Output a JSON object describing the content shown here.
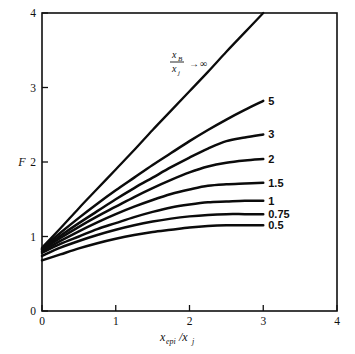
{
  "figure": {
    "background_color": "#ffffff",
    "line_color": "#0b0b0b",
    "axis_color": "#101010"
  },
  "axes": {
    "x_label_base": "x",
    "x_label_sub1": "epi",
    "x_label_slash": "/x",
    "x_label_sub2": "j",
    "y_label": "F",
    "x_ticks": [
      "0",
      "1",
      "2",
      "3",
      "4"
    ],
    "y_ticks": [
      "0",
      "1",
      "2",
      "3",
      "4"
    ]
  },
  "annotation": {
    "numerator_base": "x",
    "numerator_sub": "B",
    "denominator_base": "x",
    "denominator_sub": "j",
    "arrow": "→",
    "infinity": "∞"
  },
  "chart_data": {
    "type": "line",
    "title": "",
    "subtitle": "",
    "xlabel": "x_epi/x_j",
    "ylabel": "F",
    "xlim": [
      0,
      4
    ],
    "ylim": [
      0,
      4
    ],
    "grid": false,
    "legend_position": "inline-right-of-curve-ends",
    "x_tick_values": [
      0,
      1,
      2,
      3,
      4
    ],
    "y_tick_values": [
      0,
      1,
      2,
      3,
      4
    ],
    "annotations": [
      {
        "text": "x_B/x_j → ∞",
        "x": 1.15,
        "y": 3.25,
        "refers_to_series": "infinity"
      }
    ],
    "series": [
      {
        "name": "infinity",
        "label": "x_B/x_j → ∞",
        "x": [
          0,
          0.25,
          0.5,
          0.75,
          1,
          1.25,
          1.5,
          1.75,
          2,
          2.25,
          2.5,
          2.75,
          3
        ],
        "values": [
          0.85,
          1.11,
          1.38,
          1.64,
          1.9,
          2.16,
          2.43,
          2.69,
          2.95,
          3.21,
          3.48,
          3.74,
          4.0
        ]
      },
      {
        "name": "5",
        "label": "5",
        "x": [
          0,
          0.25,
          0.5,
          0.75,
          1,
          1.25,
          1.5,
          1.75,
          2,
          2.25,
          2.5,
          2.75,
          3
        ],
        "values": [
          0.84,
          1.05,
          1.25,
          1.44,
          1.62,
          1.79,
          1.96,
          2.12,
          2.28,
          2.43,
          2.57,
          2.7,
          2.82
        ]
      },
      {
        "name": "3",
        "label": "3",
        "x": [
          0,
          0.25,
          0.5,
          0.75,
          1,
          1.25,
          1.5,
          1.75,
          2,
          2.25,
          2.5,
          2.75,
          3
        ],
        "values": [
          0.83,
          1.01,
          1.18,
          1.34,
          1.5,
          1.65,
          1.79,
          1.93,
          2.06,
          2.18,
          2.28,
          2.33,
          2.37
        ]
      },
      {
        "name": "2",
        "label": "2",
        "x": [
          0,
          0.25,
          0.5,
          0.75,
          1,
          1.25,
          1.5,
          1.75,
          2,
          2.25,
          2.5,
          2.75,
          3
        ],
        "values": [
          0.82,
          0.98,
          1.13,
          1.27,
          1.4,
          1.53,
          1.65,
          1.76,
          1.86,
          1.94,
          1.99,
          2.02,
          2.04
        ]
      },
      {
        "name": "1.5",
        "label": "1.5",
        "x": [
          0,
          0.25,
          0.5,
          0.75,
          1,
          1.25,
          1.5,
          1.75,
          2,
          2.25,
          2.5,
          2.75,
          3
        ],
        "values": [
          0.8,
          0.94,
          1.07,
          1.19,
          1.3,
          1.4,
          1.49,
          1.57,
          1.63,
          1.68,
          1.7,
          1.71,
          1.72
        ]
      },
      {
        "name": "1",
        "label": "1",
        "x": [
          0,
          0.25,
          0.5,
          0.75,
          1,
          1.25,
          1.5,
          1.75,
          2,
          2.25,
          2.5,
          2.75,
          3
        ],
        "values": [
          0.78,
          0.9,
          1.0,
          1.1,
          1.18,
          1.26,
          1.33,
          1.39,
          1.43,
          1.46,
          1.47,
          1.48,
          1.48
        ]
      },
      {
        "name": "0.75",
        "label": "0.75",
        "x": [
          0,
          0.25,
          0.5,
          0.75,
          1,
          1.25,
          1.5,
          1.75,
          2,
          2.25,
          2.5,
          2.75,
          3
        ],
        "values": [
          0.74,
          0.85,
          0.94,
          1.02,
          1.09,
          1.15,
          1.2,
          1.24,
          1.27,
          1.29,
          1.3,
          1.3,
          1.3
        ]
      },
      {
        "name": "0.5",
        "label": "0.5",
        "x": [
          0,
          0.25,
          0.5,
          0.75,
          1,
          1.25,
          1.5,
          1.75,
          2,
          2.25,
          2.5,
          2.75,
          3
        ],
        "values": [
          0.68,
          0.76,
          0.84,
          0.91,
          0.97,
          1.02,
          1.06,
          1.09,
          1.12,
          1.14,
          1.15,
          1.15,
          1.15
        ]
      }
    ]
  }
}
